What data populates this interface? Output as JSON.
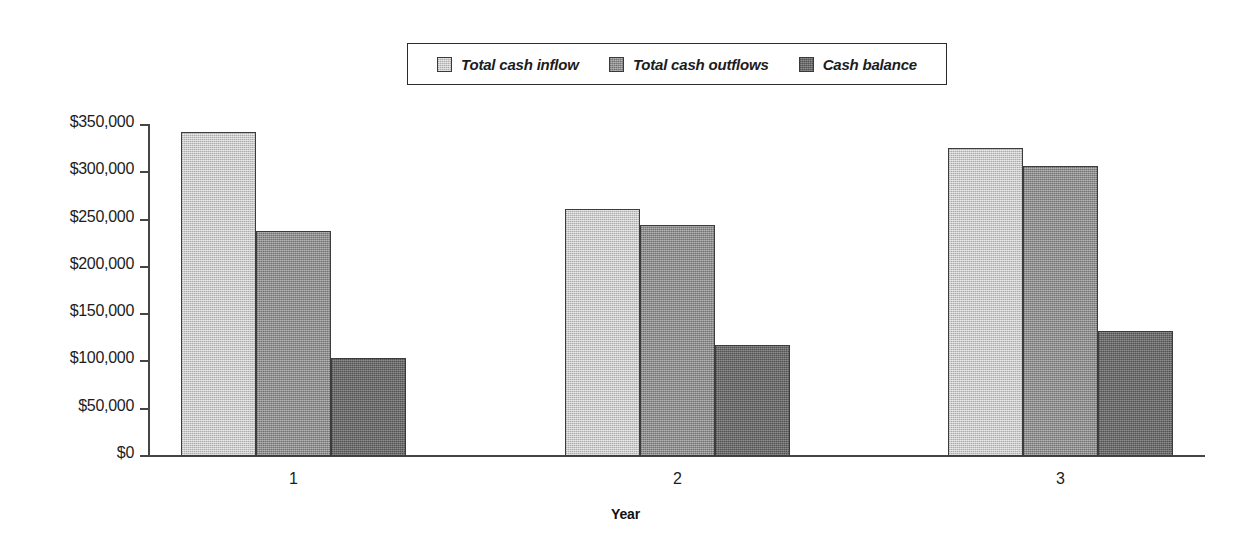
{
  "chart_data": {
    "type": "bar",
    "title": "",
    "xlabel": "Year",
    "ylabel": "",
    "categories": [
      "1",
      "2",
      "3"
    ],
    "series": [
      {
        "name": "Total cash inflow",
        "color": "#c9c9c9",
        "values": [
          343000,
          261000,
          326000
        ]
      },
      {
        "name": "Total cash outflows",
        "color": "#8f8f8f",
        "values": [
          238000,
          244000,
          307000
        ]
      },
      {
        "name": "Cash balance",
        "color": "#6b6b6b",
        "values": [
          104000,
          117000,
          132000
        ]
      }
    ],
    "ylim": [
      0,
      350000
    ],
    "ytick_values": [
      0,
      50000,
      100000,
      150000,
      200000,
      250000,
      300000,
      350000
    ],
    "ytick_labels": [
      "$0",
      "$50,000",
      "$100,000",
      "$150,000",
      "$200,000",
      "$250,000",
      "$300,000",
      "$350,000"
    ],
    "grid": false,
    "legend_position": "top-center",
    "legend_entries": [
      "Total cash inflow",
      "Total cash outflows",
      "Cash balance"
    ]
  },
  "legend": {
    "items": [
      {
        "label": "Total cash inflow"
      },
      {
        "label": "Total cash outflows"
      },
      {
        "label": "Cash balance"
      }
    ]
  },
  "axes": {
    "x_title": "Year",
    "x_labels": [
      "1",
      "2",
      "3"
    ],
    "y_labels": [
      "$350,000",
      "$300,000",
      "$250,000",
      "$200,000",
      "$150,000",
      "$100,000",
      "$50,000",
      "$0"
    ]
  }
}
